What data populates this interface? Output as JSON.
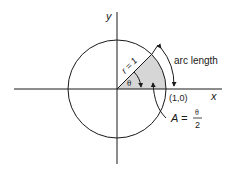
{
  "diagram": {
    "labels": {
      "y_axis": "y",
      "x_axis": "x",
      "radius": "r = 1",
      "angle": "θ",
      "arc": "arc length",
      "point": "(1,0)",
      "area_lhs": "A =",
      "area_num": "θ",
      "area_den": "2"
    },
    "colors": {
      "stroke": "#1a1a1a",
      "sector_fill": "#d6d6d6",
      "background": "#ffffff"
    }
  }
}
